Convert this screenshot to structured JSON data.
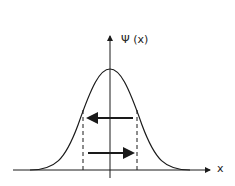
{
  "diagram": {
    "y_axis_label": "Ψ (x)",
    "x_axis_label": "x",
    "curve": "gaussian",
    "arrows": [
      {
        "direction": "left",
        "y": 118
      },
      {
        "direction": "right",
        "y": 153
      }
    ],
    "dashed_lines_x": [
      83,
      137
    ],
    "colors": {
      "stroke": "#1a1a1a",
      "background": "#ffffff"
    }
  }
}
